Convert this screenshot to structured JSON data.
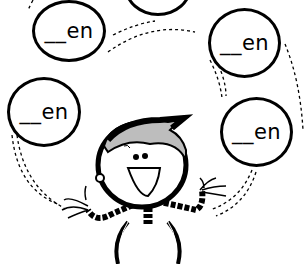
{
  "worksheet": {
    "title": "",
    "bubbles": [
      {
        "id": "top-left",
        "text": "__en"
      },
      {
        "id": "top-center",
        "text": ""
      },
      {
        "id": "upper-right",
        "text": "__en"
      },
      {
        "id": "middle-left",
        "text": "__en"
      },
      {
        "id": "lower-right",
        "text": "__en"
      }
    ]
  },
  "illustration": {
    "subject": "juggling cartoon boy",
    "colors": {
      "ink": "#000000",
      "background": "#ffffff",
      "hair_shade": "#bdbdbd"
    }
  }
}
